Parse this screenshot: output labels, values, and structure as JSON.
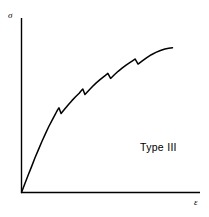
{
  "figure": {
    "background_color": "#ffffff",
    "ink_color": "#000000"
  },
  "axes": {
    "y_label": "σ",
    "y_label_name": "stress",
    "x_label": "ε",
    "x_label_name": "strain"
  },
  "annotation": {
    "series_label": "Type III"
  },
  "chart_data": {
    "type": "line",
    "title": "",
    "subtitle": "",
    "xlabel": "ε",
    "ylabel": "σ",
    "xlim": [
      0,
      1
    ],
    "ylim": [
      0,
      1
    ],
    "grid": false,
    "legend": "none",
    "annotations": [
      {
        "text": "Type III",
        "x": 0.67,
        "y": 0.27,
        "description": "serrated-yielding curve classification label"
      }
    ],
    "axis_ticks": {
      "x": [],
      "y": []
    },
    "series": [
      {
        "name": "Type III stress-strain curve",
        "x": [
          0.0,
          0.022,
          0.045,
          0.068,
          0.09,
          0.113,
          0.135,
          0.158,
          0.18,
          0.203,
          0.225,
          0.232,
          0.24,
          0.248,
          0.262,
          0.285,
          0.31,
          0.335,
          0.358,
          0.382,
          0.39,
          0.398,
          0.406,
          0.42,
          0.445,
          0.47,
          0.495,
          0.52,
          0.545,
          0.556,
          0.564,
          0.572,
          0.59,
          0.615,
          0.64,
          0.668,
          0.695,
          0.722,
          0.735,
          0.744,
          0.752,
          0.772,
          0.8,
          0.83,
          0.86,
          0.89,
          0.92,
          0.95,
          0.975,
          1.0
        ],
        "y": [
          0.0,
          0.056,
          0.112,
          0.167,
          0.221,
          0.273,
          0.323,
          0.371,
          0.416,
          0.458,
          0.497,
          0.511,
          0.524,
          0.536,
          0.5,
          0.527,
          0.556,
          0.583,
          0.606,
          0.628,
          0.638,
          0.647,
          0.655,
          0.62,
          0.646,
          0.671,
          0.694,
          0.714,
          0.733,
          0.741,
          0.748,
          0.754,
          0.722,
          0.745,
          0.767,
          0.789,
          0.808,
          0.825,
          0.833,
          0.839,
          0.845,
          0.813,
          0.833,
          0.854,
          0.872,
          0.887,
          0.899,
          0.908,
          0.913,
          0.916
        ]
      }
    ],
    "serrations": [
      {
        "index": 1,
        "drop_at_x": 0.248,
        "peak_y": 0.536,
        "trough_y": 0.5
      },
      {
        "index": 2,
        "drop_at_x": 0.406,
        "peak_y": 0.655,
        "trough_y": 0.62
      },
      {
        "index": 3,
        "drop_at_x": 0.572,
        "peak_y": 0.754,
        "trough_y": 0.722
      },
      {
        "index": 4,
        "drop_at_x": 0.752,
        "peak_y": 0.845,
        "trough_y": 0.813
      }
    ]
  }
}
